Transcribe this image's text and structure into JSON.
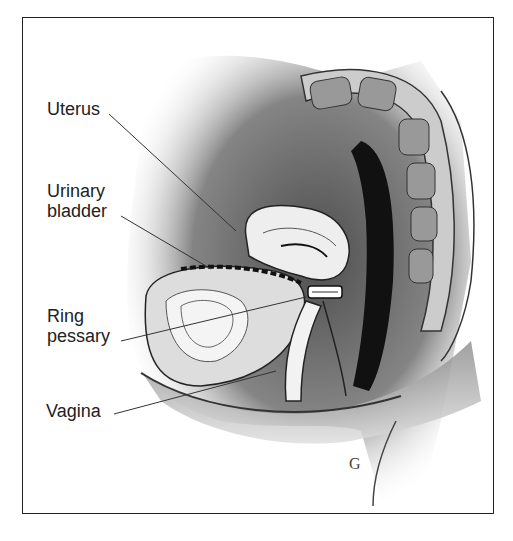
{
  "figure": {
    "type": "anatomical-illustration",
    "labels": [
      {
        "id": "uterus",
        "text": "Uterus"
      },
      {
        "id": "urinary-bladder",
        "lines": [
          "Urinary",
          "bladder"
        ]
      },
      {
        "id": "ring-pessary",
        "lines": [
          "Ring",
          "pessary"
        ]
      },
      {
        "id": "vagina",
        "text": "Vagina"
      }
    ],
    "signature": "G",
    "colors": {
      "ink": "#222222",
      "background": "#ffffff",
      "frame": "#222222"
    }
  }
}
